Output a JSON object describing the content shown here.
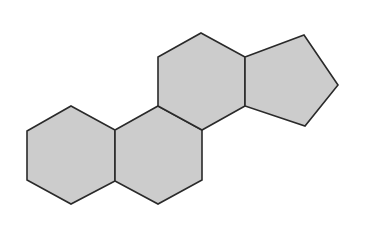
{
  "diagram": {
    "fill_color": "#cccccc",
    "stroke_color": "#2a2a2a",
    "stroke_width": 1.6,
    "background": "#ffffff",
    "shapes": [
      {
        "id": "ring-a",
        "type": "hexagon",
        "points": "71,106 115,130 115,181 71,204 27,180 27,131"
      },
      {
        "id": "ring-b",
        "type": "hexagon",
        "points": "158,106 202,130 202,180 158,204 115,181 115,130"
      },
      {
        "id": "ring-c",
        "type": "hexagon",
        "points": "201,33 245,57 245,106 202,130 158,106 158,57"
      },
      {
        "id": "ring-d",
        "type": "pentagon",
        "points": "245,57 304,35 338,85 305,126 245,106"
      }
    ]
  }
}
